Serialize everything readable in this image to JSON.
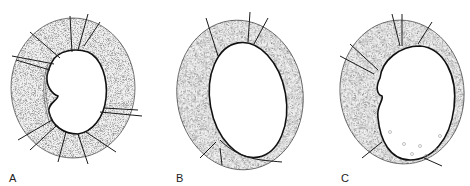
{
  "figure": {
    "panels": [
      {
        "label": "A",
        "description": "ring with many vessels, inner disc with notch"
      },
      {
        "label": "B",
        "description": "oval ring with few vessels"
      },
      {
        "label": "C",
        "description": "ring with vessels and small dots at lower disc"
      }
    ],
    "colors": {
      "ink": "#1a1a1a",
      "stipple": "#8a8a8a",
      "background": "#ffffff"
    }
  }
}
